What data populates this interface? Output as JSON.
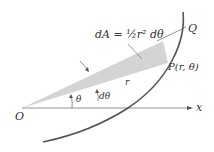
{
  "diagram": {
    "formula_label": "dA = ½r² dθ",
    "point_origin": "O",
    "point_q": "Q",
    "point_p": "P(r, θ)",
    "radius_label": "r",
    "angle_label": "θ",
    "dtheta_label": "dθ",
    "x_axis_label": "x",
    "colors": {
      "wedge_fill": "#d4d4d4",
      "curve": "#555555",
      "axis": "#666666"
    }
  }
}
